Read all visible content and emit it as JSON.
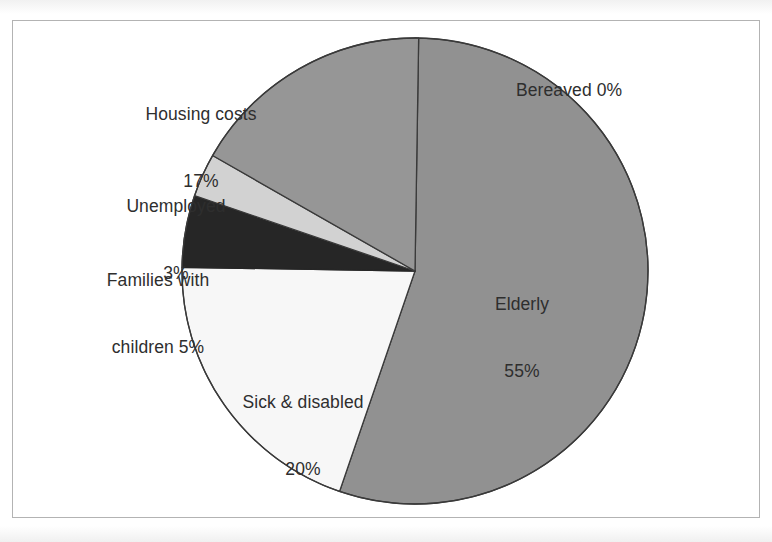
{
  "chart_data": {
    "type": "pie",
    "title": "",
    "subtitle": "",
    "xlabel": "",
    "ylabel": "",
    "legend_position": "none",
    "labels_position": "outside-and-inside",
    "start_angle_deg": 0,
    "direction": "clockwise",
    "categories": [
      "Bereaved",
      "Elderly",
      "Sick & disabled",
      "Families with children",
      "Unemployed",
      "Housing costs"
    ],
    "values": [
      0,
      55,
      20,
      5,
      3,
      17
    ],
    "unit": "%",
    "slices": [
      {
        "name": "Bereaved",
        "label": "Bereaved 0%",
        "name_line": "Bereaved 0%",
        "value_line": "",
        "value": 0,
        "value_text": "0%",
        "color": "#8e8e8e",
        "stroke": "#3a3a3a"
      },
      {
        "name": "Elderly",
        "label": "Elderly 55%",
        "name_line": "Elderly",
        "value_line": "55%",
        "value": 55,
        "value_text": "55%",
        "color": "#919191",
        "stroke": "#3a3a3a"
      },
      {
        "name": "Sick & disabled",
        "label": "Sick & disabled 20%",
        "name_line": "Sick & disabled",
        "value_line": "20%",
        "value": 20,
        "value_text": "20%",
        "color": "#f7f7f7",
        "stroke": "#3a3a3a"
      },
      {
        "name": "Families with children",
        "label": "Families with children 5%",
        "name_line": "Families with",
        "value_line": "children 5%",
        "value": 5,
        "value_text": "5%",
        "color": "#262626",
        "stroke": "#262626"
      },
      {
        "name": "Unemployed",
        "label": "Unemployed 3%",
        "name_line": "Unemployed",
        "value_line": "3%",
        "value": 3,
        "value_text": "3%",
        "color": "#d2d2d2",
        "stroke": "#3a3a3a"
      },
      {
        "name": "Housing costs",
        "label": "Housing costs 17%",
        "name_line": "Housing costs",
        "value_line": "17%",
        "value": 17,
        "value_text": "17%",
        "color": "#969696",
        "stroke": "#3a3a3a"
      }
    ]
  },
  "figure": {
    "background_color": "#ffffff",
    "frame_color": "#b3b3b3",
    "text_color": "#2e2e2e"
  }
}
